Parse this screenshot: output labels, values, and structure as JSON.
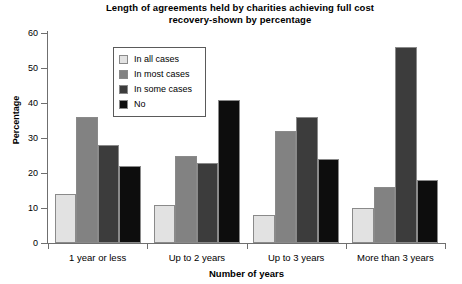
{
  "chart_data": {
    "type": "bar",
    "title": "Length of agreements held by charities achieving full cost recovery-shown by percentage",
    "title_line1": "Length of agreements held by charities achieving full cost",
    "title_line2": "recovery-shown by percentage",
    "xlabel": "Number of years",
    "ylabel": "Percentage",
    "ylim": [
      0,
      60
    ],
    "yticks": [
      0,
      10,
      20,
      30,
      40,
      50,
      60
    ],
    "ytick_labels": [
      "0",
      "10",
      "20",
      "30",
      "40",
      "50",
      "60"
    ],
    "grid": false,
    "legend_position": "upper-left-inside",
    "categories": [
      "1 year or less",
      "Up to 2 years",
      "Up to 3 years",
      "More than 3 years"
    ],
    "series": [
      {
        "name": "In all cases",
        "color": "#e2e2e2",
        "values": [
          14,
          11,
          8,
          10
        ]
      },
      {
        "name": "In most cases",
        "color": "#828282",
        "values": [
          36,
          25,
          32,
          16
        ]
      },
      {
        "name": "In some cases",
        "color": "#3c3c3c",
        "values": [
          28,
          23,
          36,
          56
        ]
      },
      {
        "name": "No",
        "color": "#0d0d0d",
        "values": [
          22,
          41,
          24,
          18
        ]
      }
    ]
  }
}
